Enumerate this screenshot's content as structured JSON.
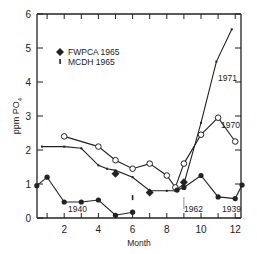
{
  "chart_data": {
    "type": "line",
    "title": "",
    "xlabel": "Month",
    "ylabel": "ppm PO4",
    "xlim": [
      0.4,
      12.4
    ],
    "ylim": [
      0,
      6
    ],
    "x_ticks": [
      "2",
      "4",
      "6",
      "8",
      "10",
      "12"
    ],
    "y_ticks": [
      "0",
      "1",
      "2",
      "3",
      "4",
      "5",
      "6"
    ],
    "grid": false,
    "legend": [
      {
        "marker": "filled-diamond",
        "label": "FWPCA 1965"
      },
      {
        "marker": "small-bar",
        "label": "MCDH  1965"
      }
    ],
    "series": [
      {
        "name": "1971",
        "marker": "x",
        "x": [
          0.7,
          2,
          3,
          4,
          4.5,
          5,
          6,
          7,
          8,
          8.5,
          9,
          10,
          10.9,
          11.8
        ],
        "y": [
          2.1,
          2.1,
          2.05,
          1.55,
          1.45,
          1.4,
          1.2,
          0.8,
          0.8,
          0.8,
          1.0,
          2.8,
          4.6,
          5.55
        ]
      },
      {
        "name": "1970",
        "marker": "open-circle",
        "x": [
          2,
          4,
          5,
          6,
          7,
          8,
          8.5,
          9,
          10,
          11,
          12
        ],
        "y": [
          2.4,
          2.1,
          1.7,
          1.45,
          1.6,
          1.25,
          0.9,
          1.6,
          2.45,
          2.95,
          2.25
        ]
      },
      {
        "name": "1940",
        "marker": "filled-circle",
        "x": [
          0.4,
          1,
          2,
          3,
          4,
          5,
          6
        ],
        "y": [
          0.95,
          1.2,
          0.47,
          0.47,
          0.53,
          0.08,
          0.17
        ]
      },
      {
        "name": "1939",
        "marker": "filled-circle",
        "x": [
          8.6,
          9,
          10,
          11,
          12,
          12.4
        ],
        "y": [
          0.82,
          0.9,
          1.25,
          0.62,
          0.57,
          0.97
        ]
      },
      {
        "name": "FWPCA 1965",
        "marker": "filled-diamond",
        "x": [
          5,
          7,
          9
        ],
        "y": [
          1.3,
          0.75,
          1.05
        ]
      },
      {
        "name": "MCDH 1965",
        "marker": "small-bar",
        "x": [
          6
        ],
        "y": [
          0.6
        ]
      },
      {
        "name": "1962",
        "marker": "range-bar",
        "x": [
          9
        ],
        "y_range": [
          0.25,
          0.6
        ]
      }
    ],
    "annotations": [
      "1971",
      "1970",
      "1940",
      "1962",
      "1939"
    ]
  }
}
